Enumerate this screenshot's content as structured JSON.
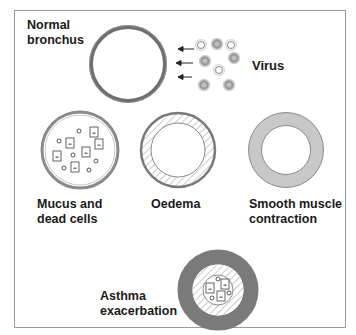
{
  "figure": {
    "labels": {
      "normal": [
        "Normal",
        "bronchus"
      ],
      "virus": "Virus",
      "mucus": [
        "Mucus and",
        "dead cells"
      ],
      "oedema": "Oedema",
      "smooth_muscle": [
        "Smooth muscle",
        "contraction"
      ],
      "asthma": [
        "Asthma",
        "exacerbation"
      ]
    },
    "colors": {
      "frame_border": "#9a9a9a",
      "ring_stroke": "#6f6f6f",
      "muscle_fill": "#c8c8c8",
      "asthma_muscle_fill": "#7a7a7a",
      "hatch": "#bdbdbd",
      "text": "#1a1a1a"
    },
    "panels": [
      {
        "id": "normal-bronchus",
        "label_ref": "normal"
      },
      {
        "id": "virus",
        "label_ref": "virus"
      },
      {
        "id": "mucus-and-dead-cells",
        "label_ref": "mucus"
      },
      {
        "id": "oedema",
        "label_ref": "oedema"
      },
      {
        "id": "smooth-muscle-contraction",
        "label_ref": "smooth_muscle"
      },
      {
        "id": "asthma-exacerbation",
        "label_ref": "asthma"
      }
    ]
  }
}
